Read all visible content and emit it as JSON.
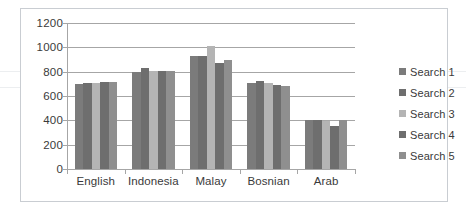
{
  "chart_data": {
    "type": "bar",
    "title": "",
    "subtitle": "",
    "xlabel": "",
    "ylabel": "",
    "categories": [
      "English",
      "Indonesia",
      "Malay",
      "Bosnian",
      "Arab"
    ],
    "series": [
      {
        "name": "Search 1",
        "color": "#7b7b7b",
        "values": [
          700,
          800,
          930,
          705,
          400
        ]
      },
      {
        "name": "Search 2",
        "color": "#6e6e6e",
        "values": [
          710,
          830,
          930,
          720,
          400
        ]
      },
      {
        "name": "Search 3",
        "color": "#b4b4b4",
        "values": [
          705,
          805,
          1010,
          710,
          393
        ]
      },
      {
        "name": "Search 4",
        "color": "#6e6e6e",
        "values": [
          715,
          808,
          875,
          690,
          355
        ]
      },
      {
        "name": "Search 5",
        "color": "#8f8f8f",
        "values": [
          718,
          808,
          900,
          685,
          405
        ]
      }
    ],
    "ylim": [
      0,
      1200
    ],
    "y_ticks": [
      0,
      200,
      400,
      600,
      800,
      1000,
      1200
    ],
    "y_tick_labels": [
      "0",
      "200",
      "400",
      "600",
      "800",
      "1000",
      "1200"
    ],
    "grid": true,
    "legend_position": "right",
    "plot_background": "#ffffff",
    "grid_color": "#a6a6a6",
    "axis_color": "#a6a6a6",
    "text_color": "#3a3a3a",
    "border_color": "#c9cdd2"
  }
}
